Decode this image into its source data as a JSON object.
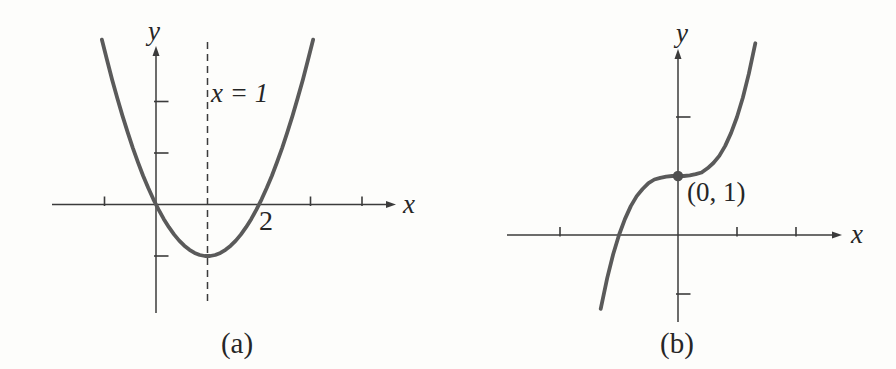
{
  "figure": {
    "background": "#fdfdfb",
    "curve_color": "#5a5a5a",
    "axis_color": "#3b3b3b",
    "point_color": "#4f4f4f",
    "text_color": "#262626"
  },
  "chart_data": [
    {
      "type": "line",
      "caption": "(a)",
      "xlabel": "x",
      "ylabel": "y",
      "curve_name": "upward-opening-parabola",
      "vertex": [
        1,
        -1
      ],
      "x_intercepts": [
        0,
        2
      ],
      "x_intercept_label": "2",
      "axis_of_symmetry": {
        "x": 1,
        "label": "x = 1",
        "line_style": "dashed"
      },
      "x_ticks": [
        -1,
        3,
        4
      ],
      "y_ticks": [
        -1,
        1,
        2
      ],
      "x_range": [
        -2,
        4.6
      ],
      "y_range": [
        -2.1,
        3.3
      ],
      "grid": false,
      "points": [
        [
          -1.05,
          3.2
        ],
        [
          -0.95,
          2.8
        ],
        [
          -0.85,
          2.42
        ],
        [
          -0.75,
          2.06
        ],
        [
          -0.65,
          1.72
        ],
        [
          -0.55,
          1.4
        ],
        [
          -0.45,
          1.1
        ],
        [
          -0.35,
          0.82
        ],
        [
          -0.25,
          0.56
        ],
        [
          -0.15,
          0.32
        ],
        [
          -0.05,
          0.1
        ],
        [
          0.05,
          -0.1
        ],
        [
          0.15,
          -0.28
        ],
        [
          0.25,
          -0.44
        ],
        [
          0.35,
          -0.58
        ],
        [
          0.45,
          -0.7
        ],
        [
          0.55,
          -0.8
        ],
        [
          0.65,
          -0.88
        ],
        [
          0.75,
          -0.94
        ],
        [
          0.85,
          -0.98
        ],
        [
          0.95,
          -1.0
        ],
        [
          1.05,
          -1.0
        ],
        [
          1.15,
          -0.98
        ],
        [
          1.25,
          -0.94
        ],
        [
          1.35,
          -0.88
        ],
        [
          1.45,
          -0.8
        ],
        [
          1.55,
          -0.7
        ],
        [
          1.65,
          -0.58
        ],
        [
          1.75,
          -0.44
        ],
        [
          1.85,
          -0.28
        ],
        [
          1.95,
          -0.1
        ],
        [
          2.05,
          0.1
        ],
        [
          2.15,
          0.32
        ],
        [
          2.25,
          0.56
        ],
        [
          2.35,
          0.82
        ],
        [
          2.45,
          1.1
        ],
        [
          2.55,
          1.4
        ],
        [
          2.65,
          1.72
        ],
        [
          2.75,
          2.06
        ],
        [
          2.85,
          2.42
        ],
        [
          2.95,
          2.8
        ],
        [
          3.05,
          3.2
        ]
      ]
    },
    {
      "type": "line",
      "caption": "(b)",
      "xlabel": "x",
      "ylabel": "y",
      "curve_name": "increasing-cubic",
      "marked_point": {
        "coords": [
          0,
          1
        ],
        "label": "(0, 1)"
      },
      "x_intercepts": [
        -1
      ],
      "x_ticks": [
        -2,
        1,
        2
      ],
      "y_ticks": [
        -1,
        2
      ],
      "x_range": [
        -2.9,
        2.8
      ],
      "y_range": [
        -1.5,
        3.3
      ],
      "grid": false,
      "points": [
        [
          -1.31,
          -1.25
        ],
        [
          -1.2,
          -0.73
        ],
        [
          -1.1,
          -0.33
        ],
        [
          -1.0,
          0
        ],
        [
          -0.9,
          0.27
        ],
        [
          -0.8,
          0.49
        ],
        [
          -0.7,
          0.66
        ],
        [
          -0.6,
          0.78
        ],
        [
          -0.5,
          0.88
        ],
        [
          -0.4,
          0.94
        ],
        [
          -0.3,
          0.97
        ],
        [
          -0.2,
          0.99
        ],
        [
          -0.1,
          1.0
        ],
        [
          0,
          1
        ],
        [
          0.1,
          1.0
        ],
        [
          0.2,
          1.01
        ],
        [
          0.3,
          1.03
        ],
        [
          0.4,
          1.06
        ],
        [
          0.5,
          1.13
        ],
        [
          0.6,
          1.22
        ],
        [
          0.7,
          1.34
        ],
        [
          0.8,
          1.51
        ],
        [
          0.9,
          1.73
        ],
        [
          1.0,
          2
        ],
        [
          1.1,
          2.33
        ],
        [
          1.2,
          2.73
        ],
        [
          1.31,
          3.25
        ]
      ]
    }
  ]
}
